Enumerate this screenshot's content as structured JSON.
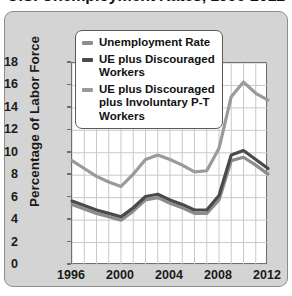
{
  "chart_data": {
    "type": "line",
    "title": "U.S. Unemployment Rates, 1996-2012",
    "xlabel": "",
    "ylabel": "Percentage of Labor Force",
    "xlim": [
      1996,
      2012
    ],
    "ylim": [
      0,
      18
    ],
    "ytick_step": 2,
    "xtick_step": 4,
    "grid": true,
    "legend_position": "top-center",
    "x": [
      1996,
      1997,
      1998,
      1999,
      2000,
      2001,
      2002,
      2003,
      2004,
      2005,
      2006,
      2007,
      2008,
      2009,
      2010,
      2011,
      2012
    ],
    "yticks": [
      "0",
      "2",
      "4",
      "6",
      "8",
      "10",
      "12",
      "14",
      "16",
      "18"
    ],
    "xticks": [
      "1996",
      "2000",
      "2004",
      "2008",
      "2012"
    ],
    "series": [
      {
        "name": "Unemployment Rate",
        "color": "#8c8c8c",
        "values": [
          5.4,
          5.0,
          4.6,
          4.3,
          4.0,
          4.8,
          5.8,
          6.0,
          5.5,
          5.1,
          4.6,
          4.6,
          5.8,
          9.3,
          9.6,
          8.9,
          8.1
        ]
      },
      {
        "name": "UE plus Discouraged Workers",
        "color": "#4a4a4a",
        "values": [
          5.7,
          5.3,
          4.9,
          4.6,
          4.3,
          5.1,
          6.1,
          6.3,
          5.8,
          5.4,
          4.9,
          4.9,
          6.2,
          9.8,
          10.2,
          9.4,
          8.6
        ]
      },
      {
        "name": "UE plus Discouraged plus Involuntary P-T Workers",
        "color": "#9a9a9a",
        "values": [
          9.3,
          8.6,
          7.9,
          7.4,
          7.0,
          8.1,
          9.4,
          9.8,
          9.4,
          8.9,
          8.3,
          8.4,
          10.4,
          15.0,
          16.3,
          15.3,
          14.7
        ]
      }
    ]
  },
  "legend": {
    "items": [
      {
        "label": "Unemployment Rate"
      },
      {
        "label": "UE plus Discouraged Workers"
      },
      {
        "label": "UE plus Discouraged plus Involuntary P-T Workers"
      }
    ]
  }
}
